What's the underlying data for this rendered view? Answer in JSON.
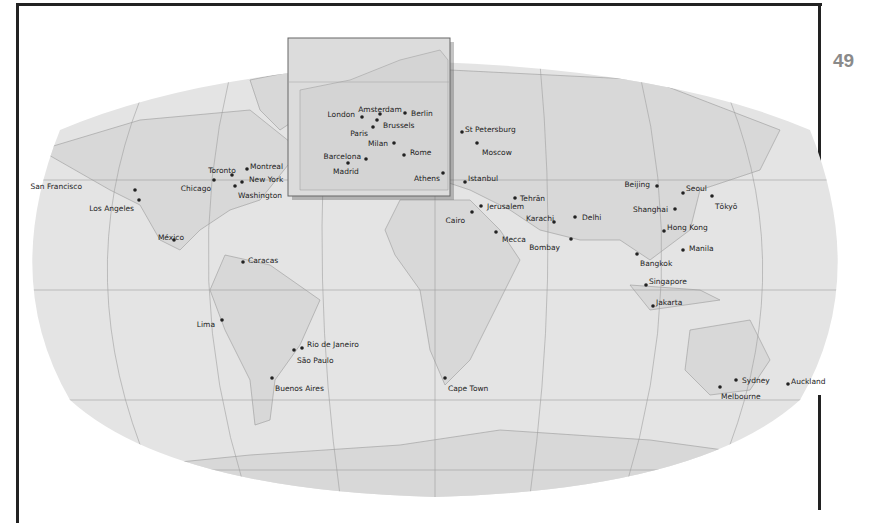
{
  "page_number": "49",
  "map": {
    "type": "world-map",
    "projection": "Robinson",
    "colors": {
      "land": "#dcdcdc",
      "ocean": "#e6e6e6",
      "lines": "#9a9a9a",
      "labels": "#222222",
      "page_number": "#8a8a8a"
    },
    "inset": {
      "name": "Europe",
      "cities": [
        {
          "name": "London",
          "label_side": "left"
        },
        {
          "name": "Amsterdam",
          "label_side": "top"
        },
        {
          "name": "Berlin",
          "label_side": "right"
        },
        {
          "name": "Brussels",
          "label_side": "right"
        },
        {
          "name": "Paris",
          "label_side": "left"
        },
        {
          "name": "Milan",
          "label_side": "left"
        },
        {
          "name": "Rome",
          "label_side": "right"
        },
        {
          "name": "Barcelona",
          "label_side": "left"
        },
        {
          "name": "Madrid",
          "label_side": "left"
        },
        {
          "name": "Athens",
          "label_side": "left"
        }
      ]
    },
    "cities": [
      {
        "name": "San Francisco"
      },
      {
        "name": "Los Angeles"
      },
      {
        "name": "Toronto"
      },
      {
        "name": "Montreal"
      },
      {
        "name": "Chicago"
      },
      {
        "name": "New York"
      },
      {
        "name": "Washington"
      },
      {
        "name": "México"
      },
      {
        "name": "Caracas"
      },
      {
        "name": "Lima"
      },
      {
        "name": "Rio de Janeiro"
      },
      {
        "name": "São Paulo"
      },
      {
        "name": "Buenos Aires"
      },
      {
        "name": "St Petersburg"
      },
      {
        "name": "Moscow"
      },
      {
        "name": "Istanbul"
      },
      {
        "name": "Tehrān"
      },
      {
        "name": "Jerusalem"
      },
      {
        "name": "Cairo"
      },
      {
        "name": "Karachi"
      },
      {
        "name": "Delhi"
      },
      {
        "name": "Mecca"
      },
      {
        "name": "Bombay"
      },
      {
        "name": "Cape Town"
      },
      {
        "name": "Beijing"
      },
      {
        "name": "Seoul"
      },
      {
        "name": "Tōkyō"
      },
      {
        "name": "Shanghai"
      },
      {
        "name": "Hong Kong"
      },
      {
        "name": "Manila"
      },
      {
        "name": "Bangkok"
      },
      {
        "name": "Singapore"
      },
      {
        "name": "Jakarta"
      },
      {
        "name": "Sydney"
      },
      {
        "name": "Melbourne"
      },
      {
        "name": "Auckland"
      }
    ]
  }
}
